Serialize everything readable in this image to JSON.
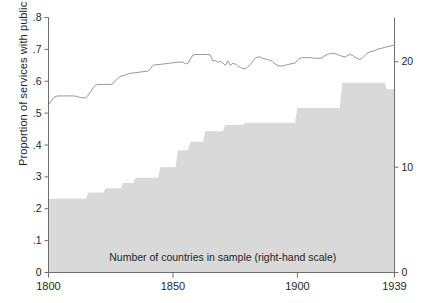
{
  "chart_data": {
    "type": "line",
    "title": "",
    "xlabel": "",
    "ylabel": "Proportion of services with public monopoly",
    "xlim": [
      1800,
      1939
    ],
    "ylim": [
      0,
      0.8
    ],
    "y2lim": [
      0,
      24.2
    ],
    "y2label": "",
    "grid": false,
    "legend": "none",
    "annotations": [
      {
        "text": "Number of countries in sample (right-hand scale)",
        "x": 1870,
        "y": 0.035
      }
    ],
    "xticks": [
      1800,
      1850,
      1900,
      1939
    ],
    "xticklabels": [
      "1800",
      "1850",
      "1900",
      "1939"
    ],
    "yticks": [
      0,
      0.1,
      0.2,
      0.3,
      0.4,
      0.5,
      0.6,
      0.7,
      0.8
    ],
    "yticklabels": [
      "0",
      ".1",
      ".2",
      ".3",
      ".4",
      ".5",
      ".6",
      ".7",
      ".8"
    ],
    "y2ticks": [
      0,
      10,
      20
    ],
    "y2ticklabels": [
      "0",
      "10",
      "20"
    ],
    "series": [
      {
        "name": "Proportion of services with public monopoly",
        "axis": "left",
        "type": "line",
        "color": "#8a8a8a",
        "x": [
          1800,
          1801,
          1802,
          1803,
          1804,
          1805,
          1806,
          1807,
          1808,
          1809,
          1810,
          1811,
          1812,
          1813,
          1814,
          1815,
          1816,
          1817,
          1818,
          1819,
          1820,
          1821,
          1822,
          1823,
          1824,
          1825,
          1826,
          1827,
          1828,
          1829,
          1830,
          1831,
          1832,
          1833,
          1834,
          1835,
          1836,
          1837,
          1838,
          1839,
          1840,
          1841,
          1842,
          1843,
          1844,
          1845,
          1846,
          1847,
          1848,
          1849,
          1850,
          1851,
          1852,
          1853,
          1854,
          1855,
          1856,
          1857,
          1858,
          1859,
          1860,
          1861,
          1862,
          1863,
          1864,
          1865,
          1866,
          1867,
          1868,
          1869,
          1870,
          1871,
          1872,
          1873,
          1874,
          1875,
          1876,
          1877,
          1878,
          1879,
          1880,
          1881,
          1882,
          1883,
          1884,
          1885,
          1886,
          1887,
          1888,
          1889,
          1890,
          1891,
          1892,
          1893,
          1894,
          1895,
          1896,
          1897,
          1898,
          1899,
          1900,
          1901,
          1902,
          1903,
          1904,
          1905,
          1906,
          1907,
          1908,
          1909,
          1910,
          1911,
          1912,
          1913,
          1914,
          1915,
          1916,
          1917,
          1918,
          1919,
          1920,
          1921,
          1922,
          1923,
          1924,
          1925,
          1926,
          1927,
          1928,
          1929,
          1930,
          1931,
          1932,
          1933,
          1934,
          1935,
          1936,
          1937,
          1938,
          1939
        ],
        "values": [
          0.525,
          0.538,
          0.548,
          0.553,
          0.554,
          0.554,
          0.554,
          0.554,
          0.554,
          0.554,
          0.554,
          0.553,
          0.551,
          0.549,
          0.548,
          0.548,
          0.557,
          0.568,
          0.58,
          0.588,
          0.59,
          0.59,
          0.59,
          0.59,
          0.59,
          0.59,
          0.593,
          0.603,
          0.61,
          0.616,
          0.617,
          0.62,
          0.623,
          0.625,
          0.626,
          0.627,
          0.628,
          0.629,
          0.63,
          0.631,
          0.632,
          0.64,
          0.65,
          0.652,
          0.652,
          0.653,
          0.654,
          0.655,
          0.656,
          0.657,
          0.658,
          0.659,
          0.66,
          0.66,
          0.66,
          0.655,
          0.656,
          0.67,
          0.682,
          0.684,
          0.684,
          0.684,
          0.684,
          0.684,
          0.684,
          0.682,
          0.664,
          0.665,
          0.66,
          0.662,
          0.658,
          0.65,
          0.664,
          0.65,
          0.656,
          0.654,
          0.648,
          0.644,
          0.64,
          0.639,
          0.645,
          0.652,
          0.662,
          0.672,
          0.676,
          0.676,
          0.672,
          0.67,
          0.668,
          0.666,
          0.662,
          0.654,
          0.65,
          0.648,
          0.648,
          0.65,
          0.652,
          0.654,
          0.656,
          0.656,
          0.666,
          0.672,
          0.674,
          0.674,
          0.674,
          0.674,
          0.673,
          0.672,
          0.672,
          0.672,
          0.674,
          0.68,
          0.684,
          0.686,
          0.688,
          0.687,
          0.684,
          0.681,
          0.678,
          0.676,
          0.68,
          0.684,
          0.682,
          0.676,
          0.672,
          0.668,
          0.672,
          0.68,
          0.688,
          0.692,
          0.694,
          0.696,
          0.7,
          0.702,
          0.704,
          0.706,
          0.708,
          0.71,
          0.712,
          0.713
        ]
      },
      {
        "name": "Number of countries in sample (right-hand scale)",
        "axis": "right",
        "type": "area",
        "color": "#d9d9d9",
        "x": [
          1800,
          1815,
          1816,
          1822,
          1823,
          1829,
          1830,
          1834,
          1835,
          1844,
          1845,
          1851,
          1852,
          1856,
          1857,
          1862,
          1863,
          1870,
          1871,
          1878,
          1879,
          1899,
          1900,
          1917,
          1918,
          1935,
          1936,
          1939
        ],
        "values": [
          7,
          7,
          7.6,
          7.6,
          8,
          8,
          8.5,
          8.5,
          9,
          9,
          10,
          10,
          11.6,
          11.6,
          12.4,
          12.4,
          13.4,
          13.4,
          14,
          14,
          14.2,
          14.2,
          15.6,
          15.6,
          18,
          18,
          17.4,
          17.4
        ]
      }
    ]
  },
  "axes": {
    "left_axis_name": "left-y-axis",
    "right_axis_name": "right-y-axis",
    "bottom_axis_name": "x-axis"
  }
}
